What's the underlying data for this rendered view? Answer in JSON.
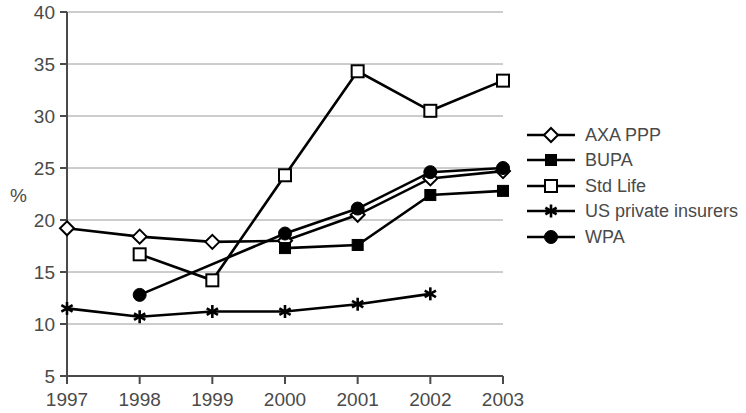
{
  "chart_data": {
    "type": "line",
    "title": "",
    "xlabel": "",
    "ylabel": "%",
    "x": [
      1997,
      1998,
      1999,
      2000,
      2001,
      2002,
      2003
    ],
    "categories": [
      "1997",
      "1998",
      "1999",
      "2000",
      "2001",
      "2002",
      "2003"
    ],
    "xlim": [
      1997,
      2003
    ],
    "ylim": [
      5,
      40
    ],
    "yticks": [
      5,
      10,
      15,
      20,
      25,
      30,
      35,
      40
    ],
    "ytick_labels": [
      "5",
      "10",
      "15",
      "20",
      "25",
      "30",
      "35",
      "40"
    ],
    "grid": "horizontal",
    "legend_position": "right",
    "series": [
      {
        "name": "AXA PPP",
        "marker": "open-diamond",
        "color": "#000000",
        "values": [
          19.2,
          18.4,
          17.9,
          18.0,
          20.5,
          24.0,
          24.7
        ]
      },
      {
        "name": "BUPA",
        "marker": "filled-square",
        "color": "#000000",
        "values": [
          null,
          null,
          null,
          17.3,
          17.6,
          22.4,
          22.8
        ]
      },
      {
        "name": "Std Life",
        "marker": "open-square",
        "color": "#000000",
        "values": [
          null,
          16.7,
          14.2,
          24.3,
          34.3,
          30.5,
          33.4
        ]
      },
      {
        "name": "US private insurers",
        "marker": "asterisk",
        "color": "#000000",
        "values": [
          11.5,
          10.7,
          11.2,
          11.2,
          11.9,
          12.9,
          null
        ]
      },
      {
        "name": "WPA",
        "marker": "filled-circle",
        "color": "#000000",
        "values": [
          null,
          12.8,
          null,
          18.7,
          21.1,
          24.6,
          25.0
        ]
      }
    ]
  },
  "legend": {
    "items": [
      {
        "label": "AXA PPP",
        "marker": "open-diamond"
      },
      {
        "label": "BUPA",
        "marker": "filled-square"
      },
      {
        "label": "Std Life",
        "marker": "open-square"
      },
      {
        "label": "US private insurers",
        "marker": "asterisk"
      },
      {
        "label": "WPA",
        "marker": "filled-circle"
      }
    ]
  },
  "axes": {
    "y_axis_label": "%",
    "y_tick_labels": [
      "40",
      "35",
      "30",
      "25",
      "20",
      "15",
      "10",
      "5"
    ],
    "x_tick_labels": [
      "1997",
      "1998",
      "1999",
      "2000",
      "2001",
      "2002",
      "2003"
    ]
  },
  "style": {
    "axis_color": "#4a4a4a",
    "grid_color": "#9a9a9a",
    "line_color": "#000000",
    "background": "#ffffff"
  }
}
